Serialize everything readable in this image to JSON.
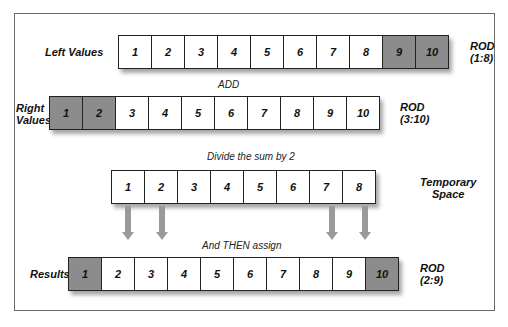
{
  "diagram": {
    "left_row": {
      "label": "Left Values",
      "cells": [
        "1",
        "2",
        "3",
        "4",
        "5",
        "6",
        "7",
        "8",
        "9",
        "10"
      ],
      "shaded": [
        8,
        9
      ],
      "rod_label": "ROD",
      "rod_range": "(1:8)"
    },
    "add_caption": "ADD",
    "right_row": {
      "label_line1": "Right",
      "label_line2": "Values",
      "cells": [
        "1",
        "2",
        "3",
        "4",
        "5",
        "6",
        "7",
        "8",
        "9",
        "10"
      ],
      "shaded": [
        0,
        1
      ],
      "rod_label": "ROD",
      "rod_range": "(3:10)"
    },
    "divide_caption": "Divide the sum by 2",
    "temp_row": {
      "cells": [
        "1",
        "2",
        "3",
        "4",
        "5",
        "6",
        "7",
        "8"
      ],
      "label_line1": "Temporary",
      "label_line2": "Space"
    },
    "assign_caption": "And THEN assign",
    "results_row": {
      "label": "Results",
      "cells": [
        "1",
        "2",
        "3",
        "4",
        "5",
        "6",
        "7",
        "8",
        "9",
        "10"
      ],
      "shaded": [
        0,
        9
      ],
      "rod_label": "ROD",
      "rod_range": "(2:9)"
    },
    "colors": {
      "shaded_cell": "#8c8c8c",
      "arrow": "#9a9a9a",
      "border": "#222222"
    }
  }
}
